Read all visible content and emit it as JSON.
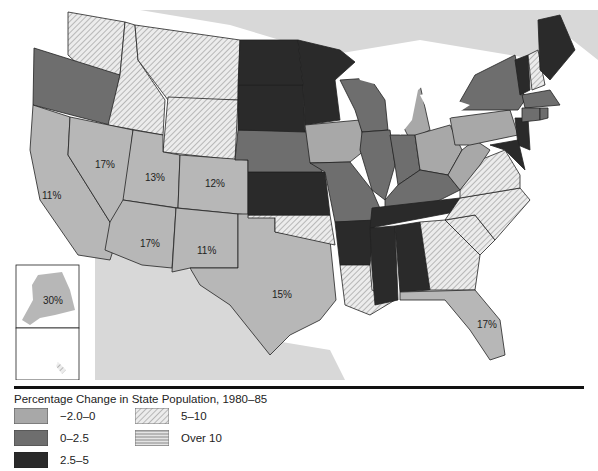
{
  "title": "Percentage Change in State Population, 1980–85",
  "legend": [
    {
      "key": "neg",
      "label": "−2.0–0",
      "pattern": "light-gray"
    },
    {
      "key": "low",
      "label": "0–2.5",
      "pattern": "dark-gray"
    },
    {
      "key": "mid",
      "label": "2.5–5",
      "pattern": "black"
    },
    {
      "key": "med",
      "label": "5–10",
      "pattern": "diagonal-hatch"
    },
    {
      "key": "high",
      "label": "Over 10",
      "pattern": "horizontal-hatch"
    }
  ],
  "colors": {
    "light": "#a8a8a8",
    "dark": "#6e6e6e",
    "black": "#2a2a2a",
    "land": "#d8d8d8",
    "water": "#ffffff"
  },
  "state_labels": [
    {
      "state": "California",
      "text": "11%"
    },
    {
      "state": "Nevada",
      "text": "17%"
    },
    {
      "state": "Utah",
      "text": "13%"
    },
    {
      "state": "Colorado",
      "text": "12%"
    },
    {
      "state": "Arizona",
      "text": "17%"
    },
    {
      "state": "New Mexico",
      "text": "11%"
    },
    {
      "state": "Texas",
      "text": "15%"
    },
    {
      "state": "Florida",
      "text": "17%"
    },
    {
      "state": "Alaska",
      "text": "30%"
    }
  ],
  "states": {
    "Washington": "med",
    "Oregon": "low",
    "California": "high",
    "Nevada": "high",
    "Idaho": "med",
    "Montana": "med",
    "Wyoming": "med",
    "Utah": "high",
    "Colorado": "high",
    "Arizona": "high",
    "New Mexico": "high",
    "Texas": "high",
    "Oklahoma": "med",
    "Kansas": "mid",
    "Nebraska": "low",
    "South Dakota": "mid",
    "North Dakota": "mid",
    "Minnesota": "mid",
    "Iowa": "neg",
    "Missouri": "low",
    "Arkansas": "mid",
    "Louisiana": "med",
    "Wisconsin": "low",
    "Illinois": "low",
    "Michigan": "neg",
    "Indiana": "low",
    "Ohio": "neg",
    "Kentucky": "low",
    "Tennessee": "mid",
    "Mississippi": "mid",
    "Alabama": "mid",
    "Georgia": "med",
    "Florida": "high",
    "South Carolina": "med",
    "North Carolina": "med",
    "Virginia": "med",
    "West Virginia": "neg",
    "Pennsylvania": "neg",
    "New York": "low",
    "New Jersey": "mid",
    "Maryland": "mid",
    "Delaware": "mid",
    "Vermont": "mid",
    "New Hampshire": "med",
    "Maine": "mid",
    "Massachusetts": "low",
    "Connecticut": "low",
    "Rhode Island": "low",
    "Alaska": "high",
    "Hawaii": "med"
  }
}
